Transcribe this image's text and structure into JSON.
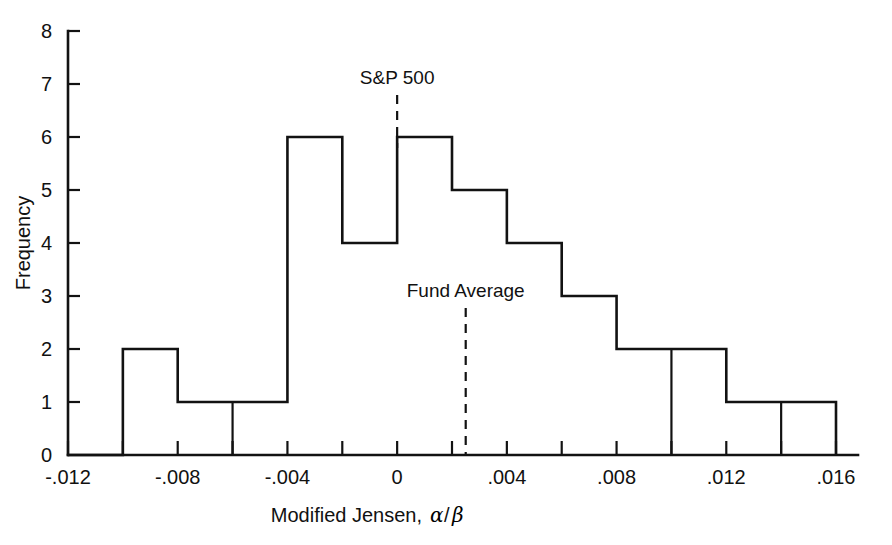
{
  "chart_data": {
    "type": "bar",
    "title": "",
    "subtitle": "",
    "xlabel": "Modified Jensen, α/β",
    "xlabel_parts": {
      "text": "Modified Jensen, ",
      "alpha": "α",
      "slash": "/",
      "beta": "β"
    },
    "ylabel": "Frequency",
    "xlim": [
      -0.012,
      0.016
    ],
    "ylim": [
      0,
      8
    ],
    "grid": false,
    "legend": "none",
    "bin_width": 0.002,
    "x_tick_labels": [
      "-.012",
      "-.008",
      "-.004",
      "0",
      ".004",
      ".008",
      ".012",
      ".016"
    ],
    "x_tick_values": [
      -0.012,
      -0.008,
      -0.004,
      0,
      0.004,
      0.008,
      0.012,
      0.016
    ],
    "x_minor_tick_values": [
      -0.01,
      -0.006,
      -0.002,
      0.002,
      0.006,
      0.01,
      0.014
    ],
    "y_tick_labels": [
      "0",
      "1",
      "2",
      "3",
      "4",
      "5",
      "6",
      "7",
      "8"
    ],
    "y_tick_values": [
      0,
      1,
      2,
      3,
      4,
      5,
      6,
      7,
      8
    ],
    "bin_edges": [
      -0.012,
      -0.01,
      -0.008,
      -0.006,
      -0.004,
      -0.002,
      0.0,
      0.002,
      0.004,
      0.006,
      0.008,
      0.01,
      0.012,
      0.014,
      0.016
    ],
    "categories": [
      "-.012 to -.010",
      "-.010 to -.008",
      "-.008 to -.006",
      "-.006 to -.004",
      "-.004 to -.002",
      "-.002 to 0",
      "0 to .002",
      ".002 to .004",
      ".004 to .006",
      ".006 to .008",
      ".008 to .010",
      ".010 to .012",
      ".012 to .014",
      ".014 to .016"
    ],
    "values": [
      0,
      2,
      1,
      1,
      6,
      4,
      6,
      5,
      4,
      3,
      2,
      2,
      1,
      1
    ],
    "annotations": [
      {
        "name": "sp500",
        "label": "S&P 500",
        "x": 0.0,
        "style": "dashed-vertical"
      },
      {
        "name": "fund-average",
        "label": "Fund Average",
        "x": 0.0025,
        "style": "dashed-vertical"
      }
    ]
  },
  "markers": {
    "sp500_label": "S&P 500",
    "fund_average_label": "Fund Average"
  },
  "axes": {
    "y_title": "Frequency",
    "x_title_text": "Modified Jensen,",
    "x_title_alpha": "α",
    "x_title_slash": "/",
    "x_title_beta": "β"
  },
  "colors": {
    "ink": "#121212",
    "background": "#ffffff"
  }
}
